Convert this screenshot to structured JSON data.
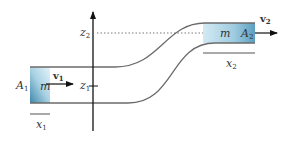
{
  "diagram": {
    "type": "fluid-flow-pipe",
    "labels": {
      "A1": "A",
      "A1_sub": "1",
      "A2": "A",
      "A2_sub": "2",
      "m_left": "m",
      "m_right": "m",
      "v1": "v",
      "v1_sub": "1",
      "v2": "v",
      "v2_sub": "2",
      "x1": "x",
      "x1_sub": "1",
      "x2": "x",
      "x2_sub": "2",
      "z1": "z",
      "z1_sub": "1",
      "z2": "z",
      "z2_sub": "2"
    },
    "colors": {
      "pipe": "#6b6b6b",
      "axis": "#111111",
      "fluid_light": "#d8ecf5",
      "fluid_dark": "#4f93b3",
      "text": "#333333"
    }
  }
}
